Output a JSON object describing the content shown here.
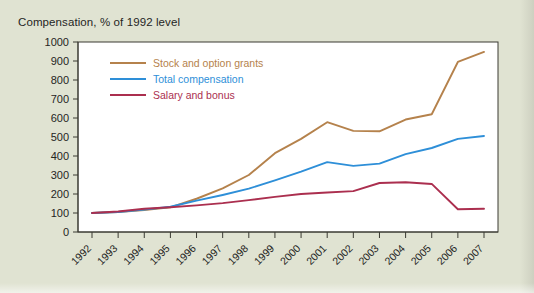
{
  "figure": {
    "title": "Compensation, % of 1992 level",
    "background_color": "#e0e3d2",
    "plot_background_color": "#ffffff",
    "axis_color": "#3a3a32"
  },
  "chart_data": {
    "type": "line",
    "title": "Compensation, % of 1992 level",
    "xlabel": "",
    "ylabel": "",
    "ylim": [
      0,
      1000
    ],
    "ytick_values": [
      0,
      100,
      200,
      300,
      400,
      500,
      600,
      700,
      800,
      900,
      1000
    ],
    "ytick_labels": [
      "0",
      "100",
      "200",
      "300",
      "400",
      "500",
      "600",
      "700",
      "800",
      "900",
      "1000"
    ],
    "grid": false,
    "legend_position": "upper-left-inside",
    "categories": [
      "1992",
      "1993",
      "1994",
      "1995",
      "1996",
      "1997",
      "1998",
      "1999",
      "2000",
      "2001",
      "2002",
      "2003",
      "2004",
      "2005",
      "2006",
      "2007"
    ],
    "x": [
      1992,
      1993,
      1994,
      1995,
      1996,
      1997,
      1998,
      1999,
      2000,
      2001,
      2002,
      2003,
      2004,
      2005,
      2006,
      2007
    ],
    "series": [
      {
        "name": "Stock and option grants",
        "color": "#b5824c",
        "values": [
          100,
          105,
          115,
          130,
          175,
          230,
          300,
          415,
          490,
          578,
          532,
          530,
          592,
          620,
          895,
          948
        ]
      },
      {
        "name": "Total compensation",
        "color": "#2e8fd8",
        "values": [
          100,
          105,
          118,
          133,
          165,
          195,
          228,
          272,
          318,
          368,
          348,
          360,
          410,
          442,
          490,
          505
        ]
      },
      {
        "name": "Salary and bonus",
        "color": "#ab2f4f",
        "values": [
          100,
          108,
          122,
          130,
          140,
          152,
          168,
          185,
          200,
          208,
          215,
          258,
          262,
          253,
          120,
          122
        ]
      }
    ]
  },
  "legend": {
    "items": [
      {
        "label": "Stock and option grants",
        "color": "#b5824c"
      },
      {
        "label": "Total compensation",
        "color": "#2e8fd8"
      },
      {
        "label": "Salary and bonus",
        "color": "#ab2f4f"
      }
    ]
  }
}
